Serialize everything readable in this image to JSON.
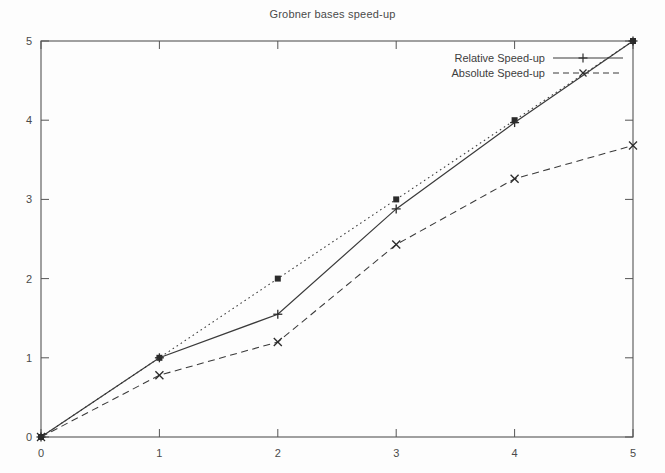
{
  "chart_data": {
    "type": "line",
    "title": "Grobner bases speed-up",
    "xlabel": "",
    "ylabel": "",
    "xlim": [
      0,
      5
    ],
    "ylim": [
      0,
      5
    ],
    "xticks": [
      "0",
      "1",
      "2",
      "3",
      "4",
      "5"
    ],
    "yticks": [
      "0",
      "1",
      "2",
      "3",
      "4",
      "5"
    ],
    "grid": false,
    "legend_position": "top-right-inside",
    "x": [
      0,
      1,
      2,
      3,
      4,
      5
    ],
    "series": [
      {
        "name": "Ideal",
        "legend_shown": false,
        "linestyle": "dotted",
        "marker": "filled-square",
        "color": "#3a3a3a",
        "values": [
          0,
          1,
          2,
          3,
          4,
          5
        ]
      },
      {
        "name": "Relative Speed-up",
        "legend_shown": true,
        "linestyle": "solid",
        "marker": "plus",
        "color": "#3a3a3a",
        "values": [
          0,
          1.0,
          1.55,
          2.88,
          3.97,
          5.0
        ]
      },
      {
        "name": "Absolute Speed-up",
        "legend_shown": true,
        "linestyle": "dashed",
        "marker": "cross",
        "color": "#3a3a3a",
        "values": [
          0,
          0.78,
          1.2,
          2.43,
          3.26,
          3.68
        ]
      }
    ]
  },
  "legend": {
    "entries": [
      {
        "label": "Relative Speed-up"
      },
      {
        "label": "Absolute Speed-up"
      }
    ]
  },
  "axes": {
    "x_tick_labels": [
      "0",
      "1",
      "2",
      "3",
      "4",
      "5"
    ],
    "y_tick_labels": [
      "0",
      "1",
      "2",
      "3",
      "4",
      "5"
    ]
  }
}
